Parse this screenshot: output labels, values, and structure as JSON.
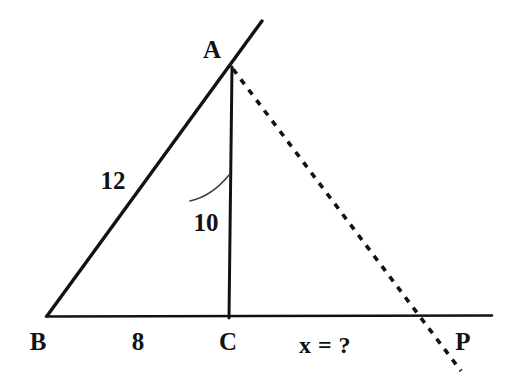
{
  "figure": {
    "kind": "geometry-diagram",
    "background_color": "#ffffff",
    "ink_color": "#121212"
  },
  "vertices": [
    {
      "name": "A",
      "label": "A",
      "label_x": 212,
      "label_y": 49,
      "point_x": 232,
      "point_y": 68
    },
    {
      "name": "B",
      "label": "B",
      "label_x": 38,
      "label_y": 341,
      "point_x": 47,
      "point_y": 316
    },
    {
      "name": "C",
      "label": "C",
      "label_x": 228,
      "label_y": 341,
      "point_x": 229,
      "point_y": 317
    },
    {
      "name": "P",
      "label": "P",
      "label_x": 463,
      "label_y": 341,
      "point_x": 430,
      "point_y": 316
    }
  ],
  "measures": [
    {
      "name": "side-ab-length",
      "label": "12",
      "x": 113,
      "y": 180,
      "segment": "BA"
    },
    {
      "name": "altitude-ac-length",
      "label": "10",
      "x": 206,
      "y": 222,
      "segment": "AC"
    },
    {
      "name": "base-bc-length",
      "label": "8",
      "x": 138,
      "y": 341,
      "segment": "BC"
    },
    {
      "name": "unknown-cp-length",
      "label": "x = ?",
      "x": 325,
      "y": 345,
      "segment": "CP"
    }
  ],
  "strokes": {
    "side_ba": {
      "x1": 47,
      "y1": 316,
      "x2": 262,
      "y2": 21,
      "style": "solid",
      "width": 3.4
    },
    "baseline_bp": {
      "x1": 46,
      "y1": 316,
      "x2": 492,
      "y2": 316,
      "style": "solid",
      "width": 2.6
    },
    "altitude_ac": {
      "x1": 232,
      "y1": 68,
      "x2": 229,
      "y2": 318,
      "style": "solid",
      "width": 3.0
    },
    "dashed_ap": {
      "x1": 233,
      "y1": 69,
      "x2": 461,
      "y2": 371,
      "style": "dashed",
      "width": 3.6,
      "dash": "6 7"
    },
    "angle_arc": {
      "from_x": 190,
      "from_y": 200,
      "to_x": 229,
      "to_y": 175,
      "style": "thin-arc",
      "width": 1.4
    }
  }
}
